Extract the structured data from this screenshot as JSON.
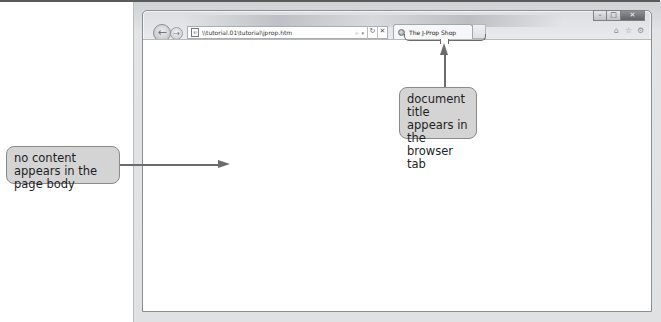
{
  "browser": {
    "address_bar": {
      "url": "\\\\tutorial.01\\tutorial\\jprop.htm",
      "search_glyph": "⌕",
      "dropdown_glyph": "▾",
      "refresh_glyph": "↻",
      "stop_glyph": "✕"
    },
    "nav": {
      "back_glyph": "←",
      "forward_glyph": "→"
    },
    "tab": {
      "title": "The J-Prop Shop"
    },
    "window_controls": {
      "minimize": "–",
      "maximize": "□",
      "close": "✕"
    },
    "toolbar": {
      "home_glyph": "⌂",
      "favorites_glyph": "☆",
      "tools_glyph": "⚙"
    }
  },
  "callouts": {
    "page_body": {
      "text": "no content appears in the page body"
    },
    "tab_title": {
      "text": "document title appears in the browser tab"
    }
  },
  "colors": {
    "callout_fill": "#d4d4d4",
    "callout_border": "#8a8a8a",
    "arrow": "#6b6b6b",
    "frame": "#dfe1e3"
  }
}
